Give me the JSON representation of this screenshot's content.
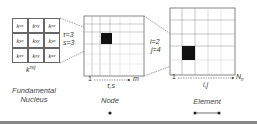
{
  "nucleus": {
    "cells": [
      [
        {
          "k": "k",
          "sub": "xx"
        },
        {
          "k": "k",
          "sub": "xy"
        },
        {
          "k": "k",
          "sub": "xz"
        }
      ],
      [
        {
          "k": "k",
          "sub": "yx"
        },
        {
          "k": "k",
          "sub": "yy"
        },
        {
          "k": "k",
          "sub": "yz"
        }
      ],
      [
        {
          "k": "k",
          "sub": "zx"
        },
        {
          "k": "k",
          "sub": "zy"
        },
        {
          "k": "k",
          "sub": "zz"
        }
      ]
    ],
    "symbol": "k",
    "superscript": "τsij",
    "caption_line1": "Fundamental",
    "caption_line2": "Nucleus"
  },
  "node_matrix": {
    "tau_label": "τ=3",
    "s_label": "s=3",
    "axis_start": "1",
    "axis_end": "m",
    "axis_label": "τ,s",
    "caption": "Node"
  },
  "element_matrix": {
    "i_label": "i=2",
    "j_label": "j=4",
    "axis_start": "1",
    "axis_end": "N",
    "axis_end_sub": "n",
    "axis_label": "i,j",
    "caption": "Element"
  }
}
